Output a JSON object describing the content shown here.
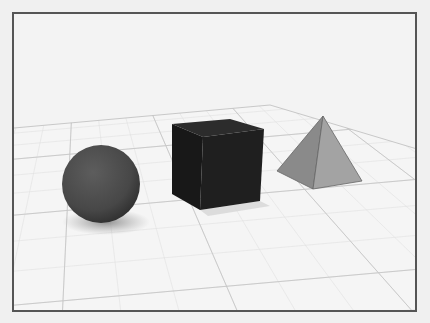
{
  "figure": {
    "ghost_text": "...al Items with Th... Spread",
    "objects": [
      {
        "name": "sphere",
        "color": "#4a4a4a"
      },
      {
        "name": "cube",
        "color": "#1c1c1c"
      },
      {
        "name": "pyramid",
        "color": "#8e8e8e"
      }
    ],
    "colors": {
      "background": "#f3f3f3",
      "frame_border": "#555555",
      "floor": "#f4f4f4",
      "grid_major": "#c8c8c8",
      "grid_minor": "#e2e2e2"
    }
  }
}
